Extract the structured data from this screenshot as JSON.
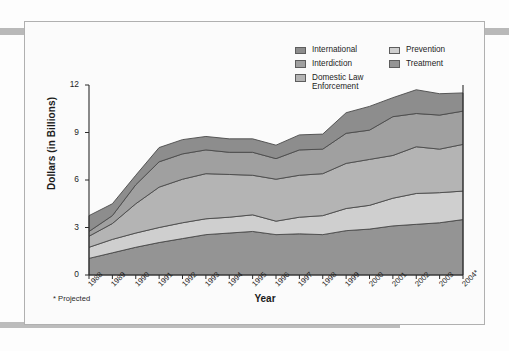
{
  "figure": {
    "footnote": "* Projected"
  },
  "legend": {
    "columns": [
      {
        "items": [
          {
            "label": "International",
            "color": "#8d8d8d",
            "name": "legend-international"
          },
          {
            "label": "Interdiction",
            "color": "#a0a0a0",
            "name": "legend-interdiction"
          },
          {
            "label": "Domestic Law\nEnforcement",
            "color": "#b4b4b4",
            "name": "legend-domestic-law-enforcement"
          }
        ]
      },
      {
        "items": [
          {
            "label": "Prevention",
            "color": "#cfcfcf",
            "name": "legend-prevention"
          },
          {
            "label": "Treatment",
            "color": "#949494",
            "name": "legend-treatment"
          }
        ]
      }
    ]
  },
  "chart_data": {
    "type": "area",
    "stacked": true,
    "title": "",
    "xlabel": "Year",
    "ylabel": "Dollars (in Billions)",
    "ylim": [
      0,
      12
    ],
    "yticks": [
      0,
      3,
      6,
      9,
      12
    ],
    "grid": false,
    "legend_position": "top-right",
    "annotations": [
      "* Projected"
    ],
    "categories": [
      "1988",
      "1989",
      "1990",
      "1991",
      "1992",
      "1993",
      "1994",
      "1995",
      "1996",
      "1997",
      "1998",
      "1999",
      "2000",
      "2001",
      "2002",
      "2003",
      "2004*"
    ],
    "series": [
      {
        "name": "Treatment",
        "color": "#949494",
        "values": [
          1.05,
          1.4,
          1.75,
          2.05,
          2.3,
          2.55,
          2.65,
          2.75,
          2.55,
          2.6,
          2.55,
          2.8,
          2.9,
          3.1,
          3.2,
          3.3,
          3.5
        ]
      },
      {
        "name": "Prevention",
        "color": "#cfcfcf",
        "values": [
          0.7,
          0.85,
          0.9,
          0.95,
          1.0,
          1.0,
          1.0,
          1.05,
          0.85,
          1.05,
          1.2,
          1.4,
          1.5,
          1.75,
          1.95,
          1.9,
          1.8
        ]
      },
      {
        "name": "Domestic Law Enforcement",
        "color": "#b4b4b4",
        "values": [
          0.7,
          1.0,
          1.85,
          2.55,
          2.75,
          2.85,
          2.7,
          2.5,
          2.65,
          2.65,
          2.65,
          2.85,
          2.9,
          2.7,
          2.95,
          2.75,
          2.95
        ]
      },
      {
        "name": "Interdiction",
        "color": "#a0a0a0",
        "values": [
          0.3,
          0.5,
          1.2,
          1.6,
          1.6,
          1.5,
          1.4,
          1.45,
          1.3,
          1.6,
          1.55,
          1.9,
          1.85,
          2.45,
          2.1,
          2.15,
          2.1
        ]
      },
      {
        "name": "International",
        "color": "#8d8d8d",
        "values": [
          1.0,
          0.75,
          0.6,
          0.9,
          0.9,
          0.85,
          0.85,
          0.85,
          0.85,
          0.95,
          0.95,
          1.3,
          1.5,
          1.2,
          1.5,
          1.35,
          1.15
        ]
      }
    ]
  },
  "axis": {
    "yticks": [
      "0",
      "3",
      "6",
      "9",
      "12"
    ],
    "xticks": [
      "1988",
      "1989",
      "1990",
      "1991",
      "1992",
      "1993",
      "1994",
      "1995",
      "1996",
      "1997",
      "1998",
      "1999",
      "2000",
      "2001",
      "2002",
      "2003",
      "2004*"
    ]
  }
}
